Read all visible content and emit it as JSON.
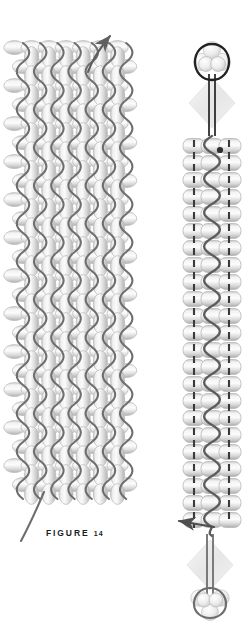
{
  "figure": {
    "caption_label": "FIGURE",
    "caption_number": "14",
    "background_color": "#ffffff"
  },
  "palette": {
    "bead_fill_light": "#f2f2f2",
    "bead_fill_mid": "#d8d8d8",
    "bead_fill_dark": "#b4b4b4",
    "bead_outline": "#b9b9b9",
    "thread_gray": "#6e6e6e",
    "thread_dark": "#2b2b2b",
    "dashed_thread": "#3a3a3a",
    "crystal_fill": "#ededed",
    "caption_color": "#1c1c1c"
  },
  "left_panel": {
    "name": "woven-beaded-band",
    "description": "Flat band of oval beads worked in columns with a wavy thread passing vertically through every column",
    "columns": 6,
    "rows": 24,
    "bead_shape": "oval",
    "bead_orientation": "vertical",
    "thread_style": "solid-wavy",
    "start_arrow": {
      "name": "needle-direction-arrow",
      "direction": "up-right",
      "from_x": 88,
      "from_y": 70,
      "to_x": 113,
      "to_y": 32
    },
    "tail_thread": {
      "name": "working-thread-tail",
      "direction": "down-left",
      "from_x": 42,
      "from_y": 492,
      "to_x": 22,
      "to_y": 540
    }
  },
  "right_panel": {
    "name": "three-column-beaded-strap",
    "description": "Narrow three-bead-wide strap with dashed existing threads at the sides and a solid serpentine thread reinforcing the centre column, finished with crystal drops and bead loops at both ends",
    "columns": 3,
    "rows": 23,
    "bead_shape": "rounded-rectangle",
    "bead_orientation": "horizontal",
    "dashed_thread_columns": [
      1,
      3
    ],
    "solid_thread_column": 2,
    "top_finding": {
      "name": "top-bead-loop",
      "loop": "thread loop over three small beads",
      "crystal": "diamond crystal bicone"
    },
    "bottom_finding": {
      "name": "bottom-bead-loop",
      "loop": "thread loop over three small beads",
      "crystal": "diamond crystal bicone"
    },
    "exit_arrow": {
      "name": "thread-exit-arrow",
      "direction": "left",
      "from_x": 215,
      "from_y": 528,
      "to_x": 176,
      "to_y": 521
    }
  }
}
